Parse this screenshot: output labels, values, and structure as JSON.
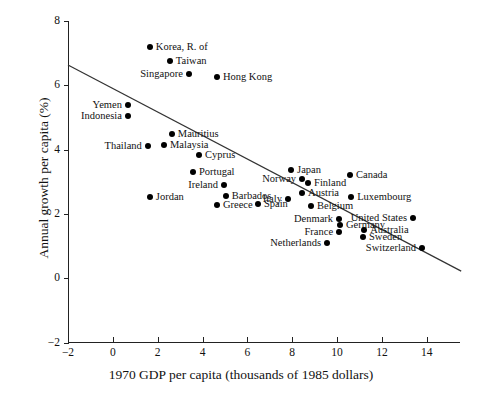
{
  "chart_data": {
    "type": "scatter",
    "title": "",
    "xlabel": "1970 GDP per capita (thousands of 1985 dollars)",
    "ylabel": "Annual growth per capita (%)",
    "xlim": [
      -2,
      15.6
    ],
    "ylim": [
      -2,
      8.3
    ],
    "xticks": [
      -2,
      0,
      2,
      4,
      6,
      8,
      10,
      12,
      14
    ],
    "xticklabels": [
      "−2",
      "0",
      "2",
      "4",
      "6",
      "8",
      "10",
      "12",
      "14"
    ],
    "yticks": [
      -2,
      0,
      2,
      4,
      6,
      8
    ],
    "yticklabels": [
      "−2",
      "0",
      "2",
      "4",
      "6",
      "8"
    ],
    "grid": false,
    "legend": "none",
    "marker": "filled-circle",
    "marker_color": "#000000",
    "fit_line": {
      "label": "regression line",
      "color": "#333333",
      "x_start": -2.0,
      "y_start": 6.63,
      "x_end": 15.54,
      "y_end": 0.22
    },
    "points": [
      {
        "name": "Korea, R. of",
        "x": 1.65,
        "y": 7.19,
        "label_side": "right"
      },
      {
        "name": "Taiwan",
        "x": 2.54,
        "y": 6.76,
        "label_side": "right"
      },
      {
        "name": "Singapore",
        "x": 3.39,
        "y": 6.35,
        "label_side": "left"
      },
      {
        "name": "Hong Kong",
        "x": 4.64,
        "y": 6.26,
        "label_side": "right"
      },
      {
        "name": "Yemen",
        "x": 0.67,
        "y": 5.38,
        "label_side": "left"
      },
      {
        "name": "Indonesia",
        "x": 0.67,
        "y": 5.04,
        "label_side": "left"
      },
      {
        "name": "Mauritius",
        "x": 2.63,
        "y": 4.48,
        "label_side": "right"
      },
      {
        "name": "Malaysia",
        "x": 2.28,
        "y": 4.13,
        "label_side": "right"
      },
      {
        "name": "Thailand",
        "x": 1.56,
        "y": 4.1,
        "label_side": "left"
      },
      {
        "name": "Cyprus",
        "x": 3.84,
        "y": 3.83,
        "label_side": "right"
      },
      {
        "name": "Portugal",
        "x": 3.57,
        "y": 3.3,
        "label_side": "right"
      },
      {
        "name": "Ireland",
        "x": 4.96,
        "y": 2.89,
        "label_side": "left"
      },
      {
        "name": "Jordan",
        "x": 1.65,
        "y": 2.52,
        "label_side": "right"
      },
      {
        "name": "Barbados",
        "x": 5.04,
        "y": 2.55,
        "label_side": "right"
      },
      {
        "name": "Greece",
        "x": 4.64,
        "y": 2.27,
        "label_side": "right"
      },
      {
        "name": "Spain",
        "x": 6.47,
        "y": 2.3,
        "label_side": "right"
      },
      {
        "name": "Italy",
        "x": 7.81,
        "y": 2.46,
        "label_side": "left"
      },
      {
        "name": "Japan",
        "x": 7.95,
        "y": 3.36,
        "label_side": "right"
      },
      {
        "name": "Norway",
        "x": 8.44,
        "y": 3.08,
        "label_side": "left"
      },
      {
        "name": "Finland",
        "x": 8.71,
        "y": 2.95,
        "label_side": "right"
      },
      {
        "name": "Austria",
        "x": 8.44,
        "y": 2.64,
        "label_side": "right"
      },
      {
        "name": "Belgium",
        "x": 8.84,
        "y": 2.24,
        "label_side": "right"
      },
      {
        "name": "Canada",
        "x": 10.58,
        "y": 3.2,
        "label_side": "right"
      },
      {
        "name": "Luxembourg",
        "x": 10.63,
        "y": 2.52,
        "label_side": "right"
      },
      {
        "name": "Denmark",
        "x": 10.09,
        "y": 1.83,
        "label_side": "left"
      },
      {
        "name": "Germany",
        "x": 10.13,
        "y": 1.67,
        "label_side": "right"
      },
      {
        "name": "France",
        "x": 10.09,
        "y": 1.45,
        "label_side": "left"
      },
      {
        "name": "United States",
        "x": 13.39,
        "y": 1.86,
        "label_side": "left"
      },
      {
        "name": "Australia",
        "x": 11.21,
        "y": 1.49,
        "label_side": "right"
      },
      {
        "name": "Sweden",
        "x": 11.16,
        "y": 1.27,
        "label_side": "right"
      },
      {
        "name": "Netherlands",
        "x": 9.55,
        "y": 1.11,
        "label_side": "left"
      },
      {
        "name": "Switzerland",
        "x": 13.79,
        "y": 0.93,
        "label_side": "left"
      }
    ]
  }
}
